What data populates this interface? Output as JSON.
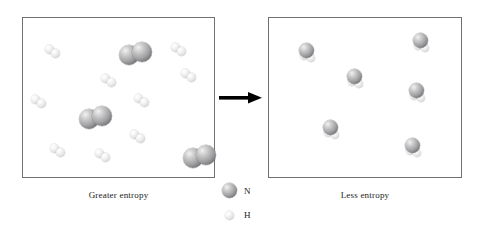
{
  "figure": {
    "left_panel": {
      "caption": "Greater entropy",
      "molecules": [
        {
          "type": "N2",
          "x": 96,
          "y": 24
        },
        {
          "type": "N2",
          "x": 56,
          "y": 88
        },
        {
          "type": "N2",
          "x": 160,
          "y": 127
        },
        {
          "type": "H2",
          "x": 22,
          "y": 27
        },
        {
          "type": "H2",
          "x": 148,
          "y": 25
        },
        {
          "type": "H2",
          "x": 78,
          "y": 56
        },
        {
          "type": "H2",
          "x": 158,
          "y": 51
        },
        {
          "type": "H2",
          "x": 8,
          "y": 77
        },
        {
          "type": "H2",
          "x": 111,
          "y": 76
        },
        {
          "type": "H2",
          "x": 107,
          "y": 112
        },
        {
          "type": "H2",
          "x": 27,
          "y": 126
        },
        {
          "type": "H2",
          "x": 72,
          "y": 131
        }
      ]
    },
    "right_panel": {
      "caption": "Less entropy",
      "molecules": [
        {
          "type": "NH3",
          "x": 29,
          "y": 25
        },
        {
          "type": "NH3",
          "x": 143,
          "y": 15
        },
        {
          "type": "NH3",
          "x": 77,
          "y": 51
        },
        {
          "type": "NH3",
          "x": 139,
          "y": 65
        },
        {
          "type": "NH3",
          "x": 53,
          "y": 102
        },
        {
          "type": "NH3",
          "x": 135,
          "y": 120
        }
      ]
    },
    "arrow": {
      "name": "reaction-arrow",
      "direction": "right"
    },
    "legend": {
      "items": [
        {
          "symbol": "N",
          "atom": "nitrogen",
          "size": "large",
          "shade": "dark"
        },
        {
          "symbol": "H",
          "atom": "hydrogen",
          "size": "small",
          "shade": "light"
        }
      ]
    }
  },
  "colors": {
    "panel_border": "#6f7073",
    "background": "#ffffff",
    "arrow": "#000000",
    "text": "#1a1a1a",
    "nitrogen_sphere": "#8f8f93",
    "hydrogen_sphere": "#e6e6e8"
  }
}
